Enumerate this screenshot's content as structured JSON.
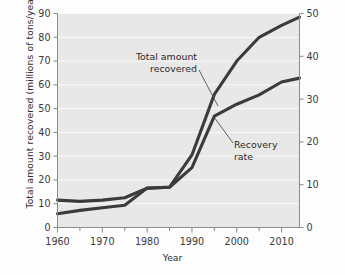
{
  "chart_data": {
    "type": "line",
    "title": "",
    "xlabel": "Year",
    "ylabel": "Total amount recovered (millions of tons/year)",
    "ylabel_right": "Recovery rate (percentage)",
    "xlim": [
      1960,
      2014
    ],
    "ylim": [
      0,
      90
    ],
    "ylim_right": [
      0,
      50
    ],
    "xticks": [
      1960,
      1970,
      1980,
      1990,
      2000,
      2010
    ],
    "xtick_labels": [
      "1960",
      "1970",
      "1980",
      "1990",
      "2000",
      "2010"
    ],
    "xminor_ticks": [
      1965,
      1975,
      1985,
      1995,
      2005
    ],
    "yticks": [
      0,
      10,
      20,
      30,
      40,
      50,
      60,
      70,
      80,
      90
    ],
    "ytick_labels": [
      "0",
      "10",
      "20",
      "30",
      "40",
      "50",
      "60",
      "70",
      "80",
      "90"
    ],
    "yticks_right": [
      0,
      10,
      20,
      30,
      40,
      50
    ],
    "ytick_labels_right": [
      "0",
      "10",
      "20",
      "30",
      "40",
      "50"
    ],
    "grid": true,
    "grid_axis": "y",
    "legend": "inline-annotations",
    "line_color": "#3b3b3b",
    "plot_background": "#e8e8e8",
    "series": [
      {
        "name": "Total amount recovered",
        "axis": "left",
        "units": "millions of tons/year",
        "x": [
          1960,
          1965,
          1970,
          1975,
          1980,
          1985,
          1990,
          1995,
          2000,
          2005,
          2010,
          2014
        ],
        "values": [
          11.5,
          11.0,
          11.5,
          12.5,
          16.5,
          17.0,
          30.5,
          56.0,
          70.0,
          80.0,
          85.0,
          88.5
        ]
      },
      {
        "name": "Recovery rate",
        "axis": "right",
        "units": "percentage",
        "x": [
          1960,
          1965,
          1970,
          1975,
          1980,
          1985,
          1990,
          1995,
          2000,
          2005,
          2010,
          2014
        ],
        "values": [
          3.2,
          4.0,
          4.6,
          5.2,
          9.2,
          9.4,
          14.0,
          26.0,
          28.8,
          31.0,
          34.0,
          34.9
        ]
      }
    ],
    "annotations": [
      {
        "name": "total-amount-recovered",
        "line1": "Total amount",
        "line2": "recovered",
        "points_to_series": "Total amount recovered"
      },
      {
        "name": "recovery-rate",
        "line1": "Recovery",
        "line2": "rate",
        "points_to_series": "Recovery rate"
      }
    ]
  }
}
